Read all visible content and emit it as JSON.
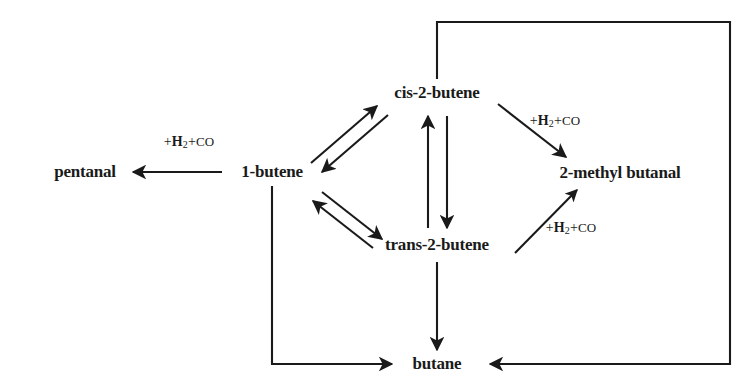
{
  "diagram": {
    "type": "reaction-scheme",
    "background_color": "#ffffff",
    "line_color": "#1a1a1a",
    "text_color": "#1a1a1a"
  },
  "nodes": [
    {
      "id": "pentanal",
      "label": "pentanal",
      "x": 85,
      "y": 172
    },
    {
      "id": "1-butene",
      "label": "1-butene",
      "x": 272,
      "y": 172
    },
    {
      "id": "cis-2-butene",
      "label": "cis-2-butene",
      "x": 437,
      "y": 93
    },
    {
      "id": "trans-2-butene",
      "label": "trans-2-butene",
      "x": 437,
      "y": 245
    },
    {
      "id": "2-methylbutanal",
      "label": "2-methyl butanal",
      "x": 620,
      "y": 173
    },
    {
      "id": "butane",
      "label": "butane",
      "x": 437,
      "y": 364
    }
  ],
  "reagents": [
    {
      "id": "reagent-pentanal",
      "plus1": "+",
      "h": "H",
      "sub": "2",
      "plus2": "+",
      "co": "CO",
      "x": 189,
      "y": 142
    },
    {
      "id": "reagent-cis-methyl",
      "plus1": "+",
      "h": "H",
      "sub": "2",
      "plus2": "+",
      "co": "CO",
      "x": 555,
      "y": 121
    },
    {
      "id": "reagent-trans-methyl",
      "plus1": "+",
      "h": "H",
      "sub": "2",
      "plus2": "+",
      "co": "CO",
      "x": 571,
      "y": 228
    },
    {
      "id": "reagent-4",
      "plus1": "+",
      "h": "H",
      "sub": "2",
      "plus2": "+",
      "co": "CO",
      "x": 189,
      "y": 142
    }
  ],
  "edges": [
    {
      "id": "edge-1butene-to-pentanal",
      "from": "1-butene",
      "to": "pentanal",
      "style": "single-arrow"
    },
    {
      "id": "edge-1butene-cis",
      "from": "1-butene",
      "to": "cis-2-butene",
      "style": "double-arrow-reversible"
    },
    {
      "id": "edge-1butene-trans",
      "from": "1-butene",
      "to": "trans-2-butene",
      "style": "double-arrow-reversible"
    },
    {
      "id": "edge-cis-trans",
      "from": "cis-2-butene",
      "to": "trans-2-butene",
      "style": "double-arrow-reversible"
    },
    {
      "id": "edge-cis-to-methylbutanal",
      "from": "cis-2-butene",
      "to": "2-methylbutanal",
      "style": "single-arrow"
    },
    {
      "id": "edge-trans-to-methylbutanal",
      "from": "trans-2-butene",
      "to": "2-methylbutanal",
      "style": "single-arrow"
    },
    {
      "id": "edge-trans-to-butane",
      "from": "trans-2-butene",
      "to": "butane",
      "style": "single-arrow"
    },
    {
      "id": "edge-1butene-to-butane",
      "from": "1-butene",
      "to": "butane",
      "style": "routed-single-arrow"
    },
    {
      "id": "edge-cis-to-butane",
      "from": "cis-2-butene",
      "to": "butane",
      "style": "routed-single-arrow"
    }
  ]
}
